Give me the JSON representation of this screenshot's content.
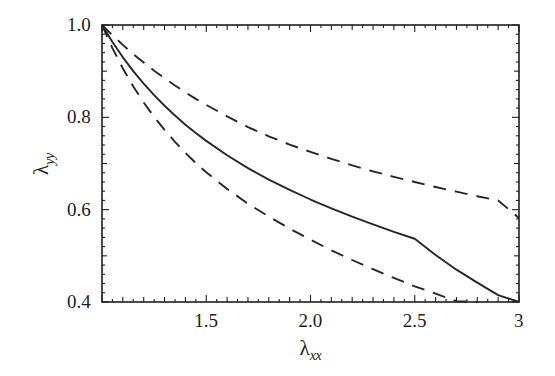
{
  "figure": {
    "background_color": "#ffffff",
    "line_color": "#262626",
    "frame_color": "#1f1f1f"
  },
  "axes": {
    "x": {
      "title_symbol": "λ",
      "title_subscript": "xx",
      "tick_labels": [
        "1.5",
        "2.0",
        "2.5",
        "3"
      ],
      "tick_values": [
        1.5,
        2.0,
        2.5,
        3.0
      ],
      "range": [
        1.0,
        3.0
      ],
      "minor_tick_step": 0.05,
      "medium_tick_step": 0.1
    },
    "y": {
      "title_symbol": "λ",
      "title_subscript": "yy",
      "tick_labels": [
        "1.0",
        "0.8",
        "0.6",
        "0.4"
      ],
      "tick_values": [
        1.0,
        0.8,
        0.6,
        0.4
      ],
      "range": [
        0.4,
        1.0
      ],
      "minor_tick_step": 0.02,
      "medium_tick_step": 0.1
    }
  },
  "chart_data": {
    "type": "line",
    "title": "",
    "xlabel": "λ_xx",
    "ylabel": "λ_yy",
    "xlim": [
      1.0,
      3.0
    ],
    "ylim": [
      0.4,
      1.0
    ],
    "grid": false,
    "legend": "none",
    "x": [
      1.0,
      1.05,
      1.1,
      1.15,
      1.2,
      1.25,
      1.3,
      1.35,
      1.4,
      1.45,
      1.5,
      1.6,
      1.7,
      1.8,
      1.9,
      2.0,
      2.1,
      2.2,
      2.3,
      2.4,
      2.5,
      2.6,
      2.7,
      2.8,
      2.9,
      3.0
    ],
    "series": [
      {
        "name": "upper-dashed",
        "style": "dashed",
        "color": "#262626",
        "values": [
          1.0,
          0.978,
          0.957,
          0.937,
          0.919,
          0.901,
          0.885,
          0.869,
          0.854,
          0.84,
          0.827,
          0.802,
          0.779,
          0.759,
          0.741,
          0.725,
          0.71,
          0.696,
          0.683,
          0.671,
          0.66,
          0.649,
          0.639,
          0.629,
          0.62,
          0.582
        ]
      },
      {
        "name": "solid-middle",
        "style": "solid",
        "color": "#262626",
        "values": [
          1.0,
          0.963,
          0.93,
          0.9,
          0.873,
          0.848,
          0.825,
          0.804,
          0.784,
          0.766,
          0.749,
          0.718,
          0.69,
          0.665,
          0.643,
          0.622,
          0.603,
          0.585,
          0.568,
          0.552,
          0.537,
          0.502,
          0.47,
          0.442,
          0.415,
          0.4
        ]
      },
      {
        "name": "lower-dashed",
        "style": "dashed",
        "color": "#262626",
        "values": [
          1.0,
          0.95,
          0.906,
          0.867,
          0.832,
          0.801,
          0.773,
          0.747,
          0.723,
          0.701,
          0.681,
          0.645,
          0.613,
          0.585,
          0.559,
          0.535,
          0.512,
          0.491,
          0.471,
          0.452,
          0.434,
          0.418,
          0.402,
          0.4,
          0.4,
          0.4
        ]
      }
    ],
    "annotations": [
      {
        "text": "solid curve reaches λ_yy = 0.4 at λ_xx ≈ 2.94"
      },
      {
        "text": "lower dashed curve reaches λ_yy = 0.4 at λ_xx ≈ 2.47"
      },
      {
        "text": "upper dashed curve ends at λ_yy ≈ 0.58 at λ_xx = 3"
      }
    ]
  }
}
